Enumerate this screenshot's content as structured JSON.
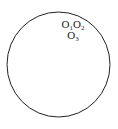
{
  "figure": {
    "type": "geometric-diagram",
    "background_color": "#ffffff",
    "circle": {
      "stroke_color": "#222222",
      "stroke_width": 1,
      "fill": "none",
      "center_x": 58.5,
      "center_y": 64.5,
      "radius_x": 51.5,
      "radius_y": 52.5
    },
    "labels": [
      {
        "id": "label-o1",
        "base": "O",
        "subscript": "1",
        "full_text": "O1",
        "line": 1,
        "x": 67,
        "y": 26
      },
      {
        "id": "label-o2",
        "base": "O",
        "subscript": "2",
        "full_text": "O2",
        "line": 1,
        "x": 78,
        "y": 26
      },
      {
        "id": "label-o3",
        "base": "O",
        "subscript": "3",
        "full_text": "O3",
        "line": 2,
        "x": 72,
        "y": 37
      }
    ],
    "line_1_text": "O1O2",
    "line_2_text": "O3",
    "text_color": "#1a1a1a"
  }
}
